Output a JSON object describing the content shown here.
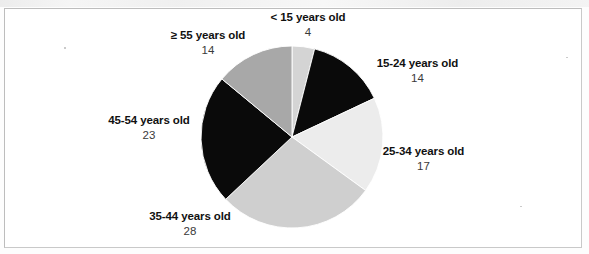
{
  "figure": {
    "background_color": "#ffffff",
    "frame_color": "#c9c9c9"
  },
  "chart_data": {
    "type": "pie",
    "title": "",
    "subtitle": "",
    "xlabel": "",
    "ylabel": "",
    "legend_position": "none",
    "grid": false,
    "total": 100,
    "units": "percent",
    "start_angle_deg": 0,
    "direction": "clockwise",
    "categories": [
      "< 15 years old",
      "15-24 years old",
      "25-34 years old",
      "35-44 years old",
      "45-54 years old",
      "≥ 55 years old"
    ],
    "values": [
      4,
      14,
      17,
      28,
      23,
      14
    ],
    "colors": [
      "#d4d4d4",
      "#0a0a0a",
      "#ececec",
      "#cfcfcf",
      "#0a0a0a",
      "#a8a8a8"
    ],
    "slices": [
      {
        "label": "< 15 years old",
        "value": 4,
        "value_text": "4",
        "color": "#d4d4d4",
        "start_deg": 0,
        "end_deg": 14.4
      },
      {
        "label": "15-24 years old",
        "value": 14,
        "value_text": "14",
        "color": "#0a0a0a",
        "start_deg": 14.4,
        "end_deg": 64.8
      },
      {
        "label": "25-34 years old",
        "value": 17,
        "value_text": "17",
        "color": "#ececec",
        "start_deg": 64.8,
        "end_deg": 126.0
      },
      {
        "label": "35-44 years old",
        "value": 28,
        "value_text": "28",
        "color": "#cfcfcf",
        "start_deg": 126.0,
        "end_deg": 226.8
      },
      {
        "label": "45-54 years old",
        "value": 23,
        "value_text": "23",
        "color": "#0a0a0a",
        "start_deg": 226.8,
        "end_deg": 309.6
      },
      {
        "label": "≥ 55 years old",
        "value": 14,
        "value_text": "14",
        "color": "#a8a8a8",
        "start_deg": 309.6,
        "end_deg": 360.0
      }
    ]
  }
}
